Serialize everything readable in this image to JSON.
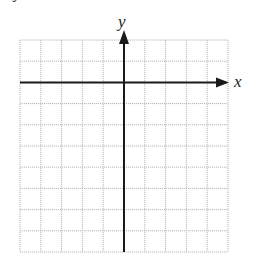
{
  "diagram": {
    "type": "coordinate-grid",
    "grid": {
      "columns": 10,
      "rows": 10,
      "left": 20,
      "top": 40,
      "cell_width": 20.8,
      "cell_height": 21.2,
      "line_color": "#b8b8b8",
      "line_style": "dotted"
    },
    "axes": {
      "x_label": "x",
      "y_label": "y",
      "axis_color": "#1a1a1a",
      "origin_column": 5,
      "origin_row": 2,
      "x_arrow": true,
      "y_arrow": true
    },
    "corner_fragment": "y"
  }
}
